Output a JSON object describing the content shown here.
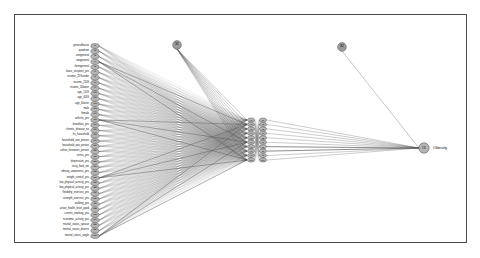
{
  "figure": {
    "type": "neural-network-diagram",
    "output_label": "Obesity",
    "border_color": "#4a4a4a",
    "node_fill": "#b4b4b4",
    "node_stroke": "#3c3c3c",
    "edge_color": "#555555",
    "bias_node_fill": "#9a9a9a"
  },
  "input_layer": {
    "name": "input-layer",
    "node_prefix": "I",
    "items": [
      {
        "id": "I1",
        "label": "generalhouse"
      },
      {
        "id": "I2",
        "label": "quadrant"
      },
      {
        "id": "I3",
        "label": "onegeneral"
      },
      {
        "id": "I4",
        "label": "twogeneral"
      },
      {
        "id": "I5",
        "label": "threegeneral"
      },
      {
        "id": "I6",
        "label": "basic_recipient_yes"
      },
      {
        "id": "I7",
        "label": "income_25%under"
      },
      {
        "id": "I8",
        "label": "income_2549"
      },
      {
        "id": "I9",
        "label": "income_50lower"
      },
      {
        "id": "I10",
        "label": "age_1529"
      },
      {
        "id": "I11",
        "label": "age_4059"
      },
      {
        "id": "I12",
        "label": "age_60over"
      },
      {
        "id": "I13",
        "label": "male"
      },
      {
        "id": "I14",
        "label": "female"
      },
      {
        "id": "I15",
        "label": "arthritis_yes"
      },
      {
        "id": "I16",
        "label": "breakfast_yes"
      },
      {
        "id": "I17",
        "label": "chronic_disease_no"
      },
      {
        "id": "I18",
        "label": "hs_household"
      },
      {
        "id": "I19",
        "label": "household_one_person"
      },
      {
        "id": "I20",
        "label": "household_two_person"
      },
      {
        "id": "I21",
        "label": "cohort_threeover_person"
      },
      {
        "id": "I22",
        "label": "stress_yes"
      },
      {
        "id": "I23",
        "label": "depression_yes"
      },
      {
        "id": "I24",
        "label": "tasty_food_eat"
      },
      {
        "id": "I25",
        "label": "obesity_awareness_yes"
      },
      {
        "id": "I26",
        "label": "weight_control_yes"
      },
      {
        "id": "I27",
        "label": "low_physical_activity_yes"
      },
      {
        "id": "I28",
        "label": "low_physical_activity_yes"
      },
      {
        "id": "I29",
        "label": "flexibility_exercise_yes"
      },
      {
        "id": "I30",
        "label": "strength_exercise_yes"
      },
      {
        "id": "I31",
        "label": "walking_yes"
      },
      {
        "id": "I32",
        "label": "active_health_level_good"
      },
      {
        "id": "I33",
        "label": "current_smoking_yes"
      },
      {
        "id": "I34",
        "label": "economic_activity_yes"
      },
      {
        "id": "I35",
        "label": "marital_status_spouse"
      },
      {
        "id": "I36",
        "label": "marital_status_divorce"
      },
      {
        "id": "I37",
        "label": "marital_status_single"
      }
    ]
  },
  "hidden_layer_1": {
    "name": "hidden-layer-1",
    "items": [
      {
        "id": "H1"
      },
      {
        "id": "H2"
      },
      {
        "id": "H3"
      },
      {
        "id": "H4"
      },
      {
        "id": "H5"
      },
      {
        "id": "H6"
      },
      {
        "id": "H7"
      },
      {
        "id": "H8"
      },
      {
        "id": "H9"
      },
      {
        "id": "H10"
      }
    ]
  },
  "hidden_layer_2": {
    "name": "hidden-layer-2",
    "items": [
      {
        "id": "J1"
      },
      {
        "id": "J2"
      },
      {
        "id": "J3"
      },
      {
        "id": "J4"
      },
      {
        "id": "J5"
      },
      {
        "id": "J6"
      },
      {
        "id": "J7"
      },
      {
        "id": "J8"
      },
      {
        "id": "J9"
      },
      {
        "id": "J10"
      }
    ]
  },
  "bias_nodes": [
    {
      "id": "B1",
      "name": "bias-node-1",
      "x": 177,
      "y": 45
    },
    {
      "id": "B2",
      "name": "bias-node-2",
      "x": 342,
      "y": 47
    }
  ],
  "output_layer": {
    "name": "output-layer",
    "node_id": "O1",
    "label": "Obesity"
  }
}
